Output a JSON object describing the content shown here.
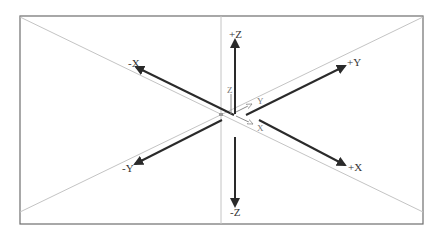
{
  "diagram": {
    "type": "3d-coordinate-axes",
    "colors": {
      "frame": "#6e6e6e",
      "guide_lines": "#c4c4c4",
      "axis_arrows": "#2a2a2a",
      "local_axes": "#9a9a9a",
      "label": "#333333"
    },
    "axis_labels": {
      "pos_z": "+Z",
      "neg_z": "-Z",
      "pos_x": "+X",
      "neg_x": "-X",
      "pos_y": "+Y",
      "neg_y": "-Y"
    },
    "local_axis_labels": {
      "z": "Z",
      "y": "Y",
      "x": "X"
    }
  }
}
